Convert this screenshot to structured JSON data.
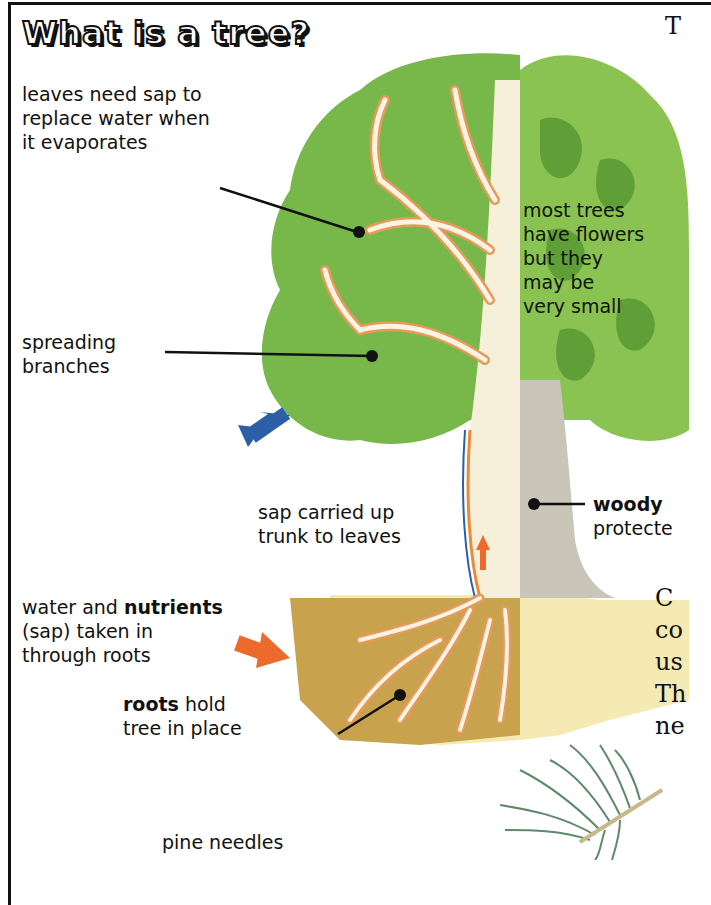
{
  "page": {
    "title": "What is a tree?"
  },
  "labels": {
    "leaves": [
      "leaves need sap to",
      "replace water when",
      "it evaporates"
    ],
    "branches": [
      "spreading",
      "branches"
    ],
    "flowers": [
      "most trees",
      "have flowers",
      "but they",
      "may be",
      "very small"
    ],
    "sap_up": [
      "sap carried up",
      "trunk to leaves"
    ],
    "woody_bold": "woody",
    "woody_rest": "protecte",
    "nutrients_pre": "water and ",
    "nutrients_bold": "nutrients",
    "nutrients_lines": [
      "(sap) taken in",
      "through roots"
    ],
    "roots_bold": "roots",
    "roots_rest": " hold",
    "roots_line2": "tree in place",
    "pine": "pine needles"
  },
  "cutoff_text": {
    "top_right": "T",
    "right_lines": [
      "C",
      "co",
      "us",
      "Th",
      "ne"
    ]
  },
  "colors": {
    "leaf_green": "#78b84a",
    "leaf_dark": "#4f8f2e",
    "trunk_light": "#f6efd9",
    "bark_gray": "#b8b4a8",
    "soil": "#c9a24e",
    "soil_light": "#f3e5a0",
    "arrow_blue": "#2d5fa8",
    "arrow_orange": "#ec6a2c"
  }
}
